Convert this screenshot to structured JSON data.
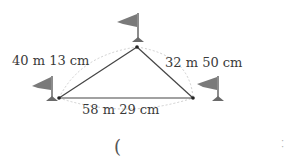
{
  "diagram": {
    "type": "triangle-distances",
    "vertices": {
      "top": {
        "x": 137,
        "y": 47
      },
      "left": {
        "x": 59,
        "y": 98
      },
      "right": {
        "x": 193,
        "y": 98
      }
    },
    "sides": [
      {
        "id": "left-side",
        "from": "left",
        "to": "top",
        "label": "40 m  13 cm"
      },
      {
        "id": "right-side",
        "from": "top",
        "to": "right",
        "label": "32 m  50 cm"
      },
      {
        "id": "bottom-side",
        "from": "left",
        "to": "right",
        "label": "58 m  29 cm"
      }
    ],
    "flags": [
      "top-flag",
      "left-flag",
      "right-flag"
    ],
    "answer_open_paren": "(",
    "colors": {
      "line": "#444444",
      "flag": "#7a7a7a",
      "dashed_arc": "#cccccc",
      "text": "#3a3a3a"
    }
  }
}
